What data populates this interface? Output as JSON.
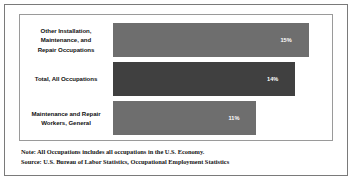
{
  "chart_data": {
    "type": "bar",
    "orientation": "horizontal",
    "title": "",
    "xlabel": "",
    "ylabel": "",
    "grid": false,
    "legend": null,
    "xlim": [
      0,
      16.5
    ],
    "categories": [
      "Other Installation, Maintenance, and Repair Occupations",
      "Total, All Occupations",
      "Maintenance and Repair Workers, General"
    ],
    "values": [
      15,
      14,
      11
    ],
    "value_labels": [
      "15%",
      "14%",
      "11%"
    ],
    "bar_colors": [
      "#6e6e6e",
      "#404040",
      "#6e6e6e"
    ],
    "annotations": [
      "Note: All Occupations includes all occupations in the U.S. Economy.",
      "Source: U.S. Bureau of Labor Statistics, Occupational Employment Statistics"
    ]
  },
  "bars": [
    {
      "label_line_1": "Other Installation,",
      "label_line_2": "Maintenance, and",
      "label_line_3": "Repair Occupations",
      "value_label": "15%",
      "width_pct": "91",
      "shade": "light"
    },
    {
      "label_line_1": "Total, All Occupations",
      "label_line_2": "",
      "label_line_3": "",
      "value_label": "14%",
      "width_pct": "84.8",
      "shade": "dark"
    },
    {
      "label_line_1": "Maintenance and Repair",
      "label_line_2": "Workers, General",
      "label_line_3": "",
      "value_label": "11%",
      "width_pct": "66.7",
      "shade": "light"
    }
  ],
  "footnotes": {
    "note": "Note: All Occupations includes all occupations in the U.S. Economy.",
    "source": "Source: U.S. Bureau of Labor Statistics, Occupational Employment Statistics"
  },
  "colors": {
    "bar_light": "#6e6e6e",
    "bar_dark": "#404040",
    "outer_border": "#7a7a7a",
    "plot_border": "#9a9a9a",
    "background": "#ffffff",
    "text": "#111111"
  }
}
